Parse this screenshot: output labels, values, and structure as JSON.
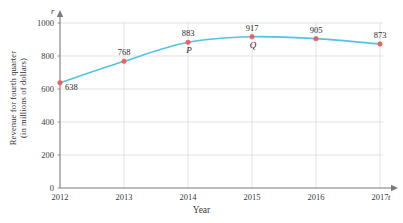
{
  "chart_data": {
    "type": "line",
    "title": "",
    "xlabel": "Year",
    "ylabel": "Revenue for fourth quarter",
    "ylabel_line2": "(in millions of dollars)",
    "x_axis_variable": "t",
    "y_axis_variable": "r",
    "categories": [
      "2012",
      "2013",
      "2014",
      "2015",
      "2016",
      "2017"
    ],
    "values": [
      638,
      768,
      883,
      917,
      905,
      873
    ],
    "data_labels": [
      "638",
      "768",
      "883",
      "917",
      "905",
      "873"
    ],
    "point_annotations": [
      {
        "index": 2,
        "label": "P"
      },
      {
        "index": 3,
        "label": "Q"
      }
    ],
    "yticks": [
      0,
      200,
      400,
      600,
      800,
      1000
    ],
    "ytick_labels": [
      "0",
      "200",
      "400",
      "600",
      "800",
      "1000"
    ],
    "xtick_labels": [
      "2012",
      "2013",
      "2014",
      "2015",
      "2016",
      "2017"
    ],
    "ylim": [
      0,
      1000
    ],
    "grid": true,
    "legend": "none",
    "line_color": "#4FC3E8",
    "marker_color": "#E8635A",
    "grid_color": "#D6D6D6",
    "axis_color": "#7A7A7A"
  }
}
